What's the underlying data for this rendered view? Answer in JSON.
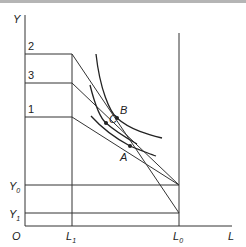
{
  "diagram": {
    "axes": {
      "y_label": "Y",
      "x_label": "L",
      "origin_label": "O"
    },
    "y_levels": [
      {
        "label": "2",
        "y": 54
      },
      {
        "label": "3",
        "y": 83
      },
      {
        "label": "1",
        "y": 117
      }
    ],
    "y_markers": [
      {
        "label": "Y",
        "sub": "0",
        "y": 185
      },
      {
        "label": "Y",
        "sub": "1",
        "y": 213
      }
    ],
    "x_markers": [
      {
        "label": "L",
        "sub": "1",
        "x": 72
      },
      {
        "label": "L",
        "sub": "0",
        "x": 179
      }
    ],
    "points": [
      {
        "label": "B",
        "x": 117,
        "y": 118
      },
      {
        "label": "C",
        "x": 106,
        "y": 123
      },
      {
        "label": "A",
        "x": 130,
        "y": 146
      }
    ],
    "colors": {
      "line": "#333333",
      "curve": "#222222",
      "topbar": "#b5b5b5"
    }
  }
}
